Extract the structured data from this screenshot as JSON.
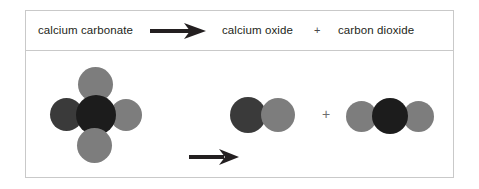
{
  "figure": {
    "border_color": "#c9c9c9",
    "background": "#ffffff"
  },
  "word_equation": {
    "reactant": "calcium carbonate",
    "arrow_icon": "reaction-arrow-icon",
    "product_1": "calcium oxide",
    "plus": "+",
    "product_2": "carbon dioxide",
    "text_color": "#231f20"
  },
  "particle_model": {
    "arrow_icon": "reaction-arrow-icon",
    "plus": "+",
    "colors": {
      "calcium": "#3a3a3a",
      "carbon": "#1c1c1c",
      "oxygen": "#7d7d7d"
    },
    "reactant": {
      "name": "calcium-carbonate-model",
      "atoms": [
        {
          "element": "calcium",
          "label": "Ca",
          "color": "#3a3a3a"
        },
        {
          "element": "carbon",
          "label": "C",
          "color": "#1c1c1c"
        },
        {
          "element": "oxygen",
          "label": "O",
          "color": "#7d7d7d"
        },
        {
          "element": "oxygen",
          "label": "O",
          "color": "#7d7d7d"
        },
        {
          "element": "oxygen",
          "label": "O",
          "color": "#7d7d7d"
        }
      ]
    },
    "product_1": {
      "name": "calcium-oxide-model",
      "atoms": [
        {
          "element": "calcium",
          "label": "Ca",
          "color": "#3a3a3a"
        },
        {
          "element": "oxygen",
          "label": "O",
          "color": "#7d7d7d"
        }
      ]
    },
    "product_2": {
      "name": "carbon-dioxide-model",
      "atoms": [
        {
          "element": "oxygen",
          "label": "O",
          "color": "#7d7d7d"
        },
        {
          "element": "carbon",
          "label": "C",
          "color": "#1c1c1c"
        },
        {
          "element": "oxygen",
          "label": "O",
          "color": "#7d7d7d"
        }
      ]
    }
  }
}
